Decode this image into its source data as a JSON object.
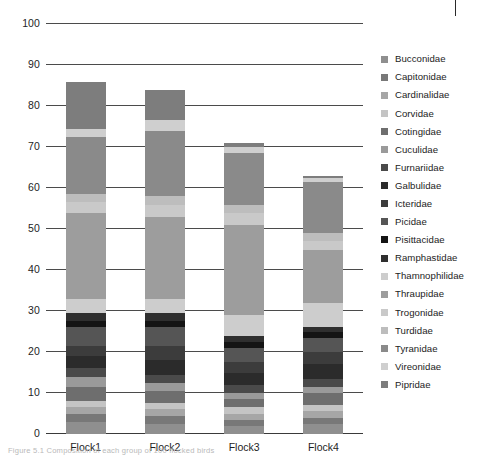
{
  "figure": {
    "caption": "Figure 5.1  Composition of each group of 100 flocked birds"
  },
  "chart_data": {
    "type": "bar",
    "stacked": true,
    "title": "",
    "xlabel": "",
    "ylabel": "",
    "ylim": [
      0,
      100
    ],
    "ytick_step": 10,
    "grid": true,
    "legend_position": "right",
    "categories": [
      "Flock1",
      "Flock2",
      "Flock3",
      "Flock4"
    ],
    "ytick_labels": [
      "0",
      "10",
      "20",
      "30",
      "40",
      "50",
      "60",
      "70",
      "80",
      "90",
      "100"
    ],
    "totals": [
      86,
      84,
      71,
      61
    ],
    "series": [
      {
        "name": "Bucconidae",
        "color": "#8f8f8f",
        "values": [
          3.0,
          2.5,
          2.0,
          2.5
        ]
      },
      {
        "name": "Capitonidae",
        "color": "#787878",
        "values": [
          2.0,
          2.0,
          1.5,
          1.5
        ]
      },
      {
        "name": "Cardinalidae",
        "color": "#a6a6a6",
        "values": [
          1.5,
          1.5,
          1.5,
          1.5
        ]
      },
      {
        "name": "Corvidae",
        "color": "#c4c4c4",
        "values": [
          1.5,
          1.5,
          1.5,
          1.5
        ]
      },
      {
        "name": "Cotingidae",
        "color": "#6e6e6e",
        "values": [
          3.5,
          3.0,
          2.0,
          3.0
        ]
      },
      {
        "name": "Cuculidae",
        "color": "#9a9a9a",
        "values": [
          2.5,
          2.0,
          1.5,
          1.5
        ]
      },
      {
        "name": "Furnariidae",
        "color": "#4a4a4a",
        "values": [
          2.0,
          2.0,
          2.0,
          2.0
        ]
      },
      {
        "name": "Galbulidae",
        "color": "#2b2b2b",
        "values": [
          3.0,
          3.5,
          3.0,
          3.5
        ]
      },
      {
        "name": "Icteridae",
        "color": "#3c3c3c",
        "values": [
          2.5,
          3.5,
          2.5,
          3.0
        ]
      },
      {
        "name": "Picidae",
        "color": "#555555",
        "values": [
          4.5,
          4.5,
          3.5,
          3.5
        ]
      },
      {
        "name": "Pisittacidae",
        "color": "#141414",
        "values": [
          1.5,
          1.5,
          1.5,
          1.5
        ]
      },
      {
        "name": "Ramphastidae",
        "color": "#2f2f2f",
        "values": [
          2.0,
          2.0,
          1.5,
          1.0
        ]
      },
      {
        "name": "Thamnophilidae",
        "color": "#cdcdcd",
        "values": [
          3.5,
          3.5,
          5.0,
          6.0
        ]
      },
      {
        "name": "Thraupidae",
        "color": "#9d9d9d",
        "values": [
          21.0,
          20.0,
          22.0,
          13.0
        ]
      },
      {
        "name": "Trogonidae",
        "color": "#c9c9c9",
        "values": [
          2.5,
          3.0,
          3.0,
          2.0
        ]
      },
      {
        "name": "Turdidae",
        "color": "#bdbdbd",
        "values": [
          2.0,
          2.0,
          2.0,
          2.0
        ]
      },
      {
        "name": "Tyranidae",
        "color": "#8a8a8a",
        "values": [
          14.0,
          16.0,
          12.5,
          12.5
        ]
      },
      {
        "name": "Vireonidae",
        "color": "#cfcfcf",
        "values": [
          2.0,
          2.5,
          1.5,
          1.0
        ]
      },
      {
        "name": "Pipridae",
        "color": "#7d7d7d",
        "values": [
          11.5,
          7.5,
          1.0,
          0.5
        ]
      }
    ]
  },
  "legend": {
    "items": [
      {
        "label": "Bucconidae",
        "color": "#8f8f8f"
      },
      {
        "label": "Capitonidae",
        "color": "#787878"
      },
      {
        "label": "Cardinalidae",
        "color": "#a6a6a6"
      },
      {
        "label": "Corvidae",
        "color": "#c4c4c4"
      },
      {
        "label": "Cotingidae",
        "color": "#6e6e6e"
      },
      {
        "label": "Cuculidae",
        "color": "#9a9a9a"
      },
      {
        "label": "Furnariidae",
        "color": "#4a4a4a"
      },
      {
        "label": "Galbulidae",
        "color": "#2b2b2b"
      },
      {
        "label": "Icteridae",
        "color": "#3c3c3c"
      },
      {
        "label": "Picidae",
        "color": "#555555"
      },
      {
        "label": "Pisittacidae",
        "color": "#141414"
      },
      {
        "label": "Ramphastidae",
        "color": "#2f2f2f"
      },
      {
        "label": "Thamnophilidae",
        "color": "#cdcdcd"
      },
      {
        "label": "Thraupidae",
        "color": "#9d9d9d"
      },
      {
        "label": "Trogonidae",
        "color": "#c9c9c9"
      },
      {
        "label": "Turdidae",
        "color": "#bdbdbd"
      },
      {
        "label": "Tyranidae",
        "color": "#8a8a8a"
      },
      {
        "label": "Vireonidae",
        "color": "#cfcfcf"
      },
      {
        "label": "Pipridae",
        "color": "#7d7d7d"
      }
    ]
  }
}
